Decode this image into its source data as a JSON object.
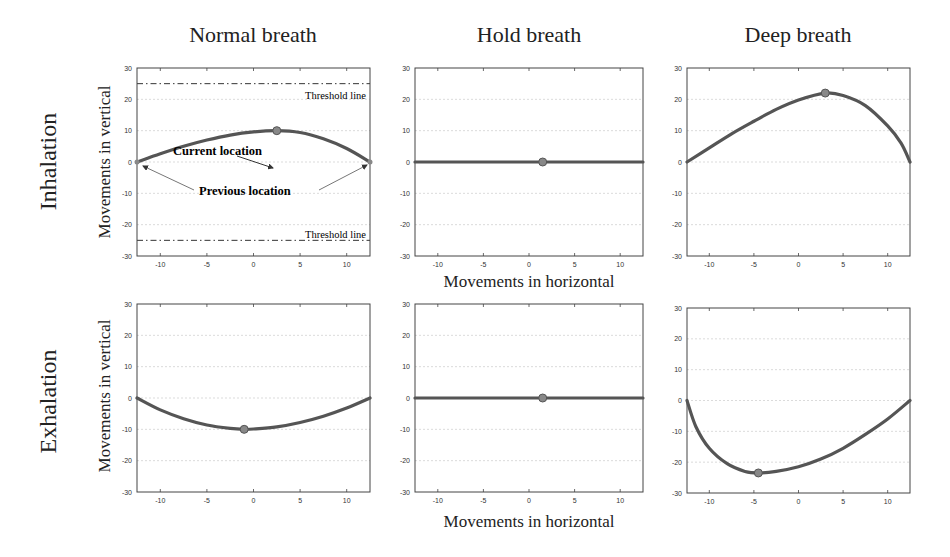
{
  "figure": {
    "column_titles": [
      "Normal breath",
      "Hold breath",
      "Deep breath"
    ],
    "row_labels": [
      "Inhalation",
      "Exhalation"
    ],
    "y_axis_title": "Movements in vertical",
    "x_axis_title": "Movements in horizontal",
    "annotations": {
      "current_location": "Current location",
      "previous_location": "Previous location",
      "threshold_upper": "Threshold line",
      "threshold_lower": "Threshold line"
    },
    "colors": {
      "curve": "#555555",
      "marker": "#888888",
      "axis": "#444444",
      "grid": "#cccccc"
    }
  },
  "chart_data": [
    {
      "type": "line",
      "id": "inhalation-normal",
      "title": "Normal breath",
      "row": "Inhalation",
      "xlabel": "",
      "ylabel": "Movements in vertical",
      "xlim": [
        -12.5,
        12.5
      ],
      "ylim": [
        -30,
        30
      ],
      "xticks": [
        -10,
        -5,
        0,
        5,
        10
      ],
      "yticks": [
        -30,
        -20,
        -10,
        0,
        10,
        20,
        30
      ],
      "grid": true,
      "x": [
        -12.5,
        -10,
        -7.5,
        -5,
        -2.5,
        0,
        2.5,
        5,
        7.5,
        10,
        12.5
      ],
      "y": [
        0,
        2.6,
        5.0,
        7.0,
        8.6,
        9.6,
        10,
        9.4,
        7.4,
        4.3,
        0
      ],
      "current_location": [
        2.5,
        10
      ],
      "previous_location": [
        [
          -12.5,
          0
        ],
        [
          12.5,
          0
        ]
      ],
      "threshold_lines": [
        25,
        -25
      ],
      "annotations": [
        "Current location",
        "Previous location",
        "Threshold line",
        "Threshold line"
      ]
    },
    {
      "type": "line",
      "id": "inhalation-hold",
      "title": "Hold breath",
      "row": "Inhalation",
      "xlabel": "Movements in horizontal",
      "ylabel": "",
      "xlim": [
        -12.5,
        12.5
      ],
      "ylim": [
        -30,
        30
      ],
      "xticks": [
        -10,
        -5,
        0,
        5,
        10
      ],
      "yticks": [
        -30,
        -20,
        -10,
        0,
        10,
        20,
        30
      ],
      "grid": true,
      "x": [
        -12.5,
        12.5
      ],
      "y": [
        0,
        0
      ],
      "current_location": [
        1.5,
        0
      ]
    },
    {
      "type": "line",
      "id": "inhalation-deep",
      "title": "Deep breath",
      "row": "Inhalation",
      "xlabel": "",
      "ylabel": "",
      "xlim": [
        -12.5,
        12.5
      ],
      "ylim": [
        -30,
        30
      ],
      "xticks": [
        -10,
        -5,
        0,
        5,
        10
      ],
      "yticks": [
        -30,
        -20,
        -10,
        0,
        10,
        20,
        30
      ],
      "grid": true,
      "x": [
        -12.5,
        -10,
        -7.5,
        -5,
        -2.5,
        0,
        3,
        5,
        7.5,
        10,
        11.5,
        12.5
      ],
      "y": [
        0,
        4.5,
        9.0,
        13.0,
        16.8,
        19.8,
        22,
        21.2,
        18.0,
        11.5,
        6.0,
        0
      ],
      "current_location": [
        3,
        22
      ]
    },
    {
      "type": "line",
      "id": "exhalation-normal",
      "title": "Normal breath",
      "row": "Exhalation",
      "xlabel": "",
      "ylabel": "Movements in vertical",
      "xlim": [
        -12.5,
        12.5
      ],
      "ylim": [
        -30,
        30
      ],
      "xticks": [
        -10,
        -5,
        0,
        5,
        10
      ],
      "yticks": [
        -30,
        -20,
        -10,
        0,
        10,
        20,
        30
      ],
      "grid": true,
      "x": [
        -12.5,
        -10,
        -7.5,
        -5,
        -2.5,
        -1,
        0,
        2.5,
        5,
        7.5,
        10,
        12.5
      ],
      "y": [
        0,
        -3.8,
        -6.6,
        -8.6,
        -9.7,
        -10,
        -9.9,
        -9.2,
        -7.8,
        -5.8,
        -3.2,
        0
      ],
      "current_location": [
        -1,
        -10
      ]
    },
    {
      "type": "line",
      "id": "exhalation-hold",
      "title": "Hold breath",
      "row": "Exhalation",
      "xlabel": "Movements in horizontal",
      "ylabel": "",
      "xlim": [
        -12.5,
        12.5
      ],
      "ylim": [
        -30,
        30
      ],
      "xticks": [
        -10,
        -5,
        0,
        5,
        10
      ],
      "yticks": [
        -30,
        -20,
        -10,
        0,
        10,
        20,
        30
      ],
      "grid": true,
      "x": [
        -12.5,
        12.5
      ],
      "y": [
        0,
        0
      ],
      "current_location": [
        1.5,
        0
      ]
    },
    {
      "type": "line",
      "id": "exhalation-deep",
      "title": "Deep breath",
      "row": "Exhalation",
      "xlabel": "",
      "ylabel": "",
      "xlim": [
        -12.5,
        12.5
      ],
      "ylim": [
        -30,
        30
      ],
      "xticks": [
        -10,
        -5,
        0,
        5,
        10
      ],
      "yticks": [
        -30,
        -20,
        -10,
        0,
        10,
        20,
        30
      ],
      "grid": true,
      "x": [
        -12.5,
        -11.5,
        -10,
        -8,
        -6,
        -4.5,
        -2.5,
        0,
        2.5,
        5,
        7.5,
        10,
        12.5
      ],
      "y": [
        0,
        -8.5,
        -15.5,
        -20.5,
        -23,
        -23.5,
        -23,
        -21.5,
        -19,
        -15.5,
        -11,
        -6,
        0
      ],
      "current_location": [
        -4.5,
        -23.5
      ]
    }
  ]
}
